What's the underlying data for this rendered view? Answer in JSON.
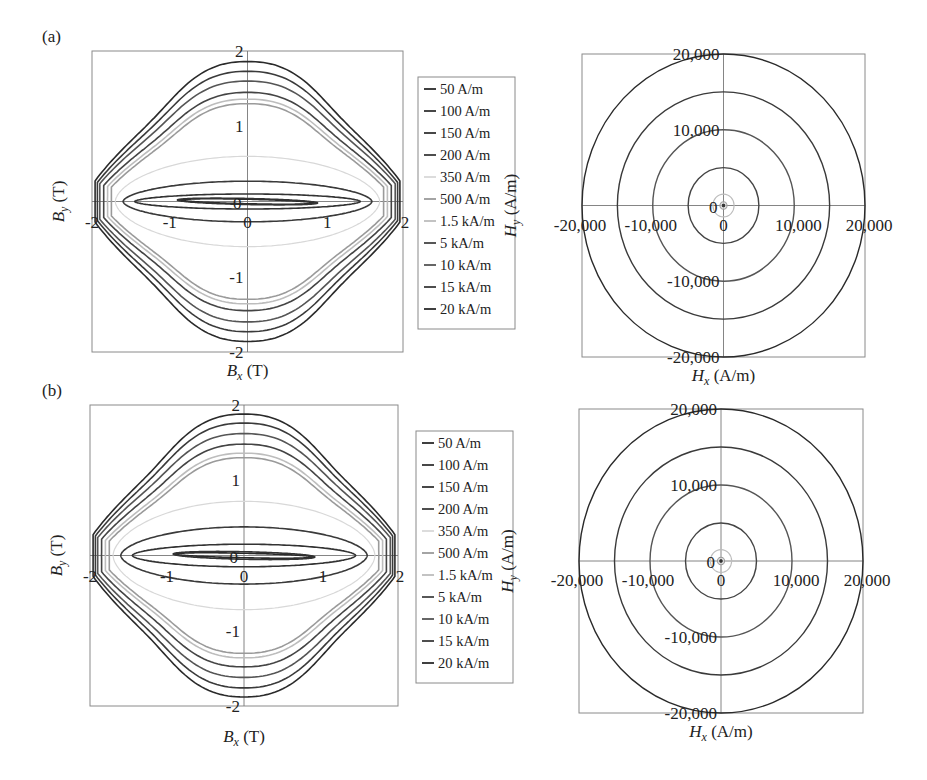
{
  "figure": {
    "panels": [
      "(a)",
      "(b)"
    ]
  },
  "chart_data": [
    {
      "id": "a-B",
      "panel": "(a)",
      "type": "line",
      "title": "",
      "xlabel": "B_x (T)",
      "ylabel": "B_y (T)",
      "xlim": [
        -2,
        2
      ],
      "ylim": [
        -2,
        2
      ],
      "xticks": [
        "-2",
        "-1",
        "0",
        "1",
        "2"
      ],
      "yticks": [
        "-2",
        "-1",
        "0",
        "1",
        "2"
      ],
      "grid": false,
      "legend_position": "right",
      "series": [
        {
          "name": "50 A/m",
          "shape": "thin-loop",
          "bx_max": 0.85,
          "by_max": 0.03,
          "color": "#2a2a2a"
        },
        {
          "name": "100 A/m",
          "shape": "thin-loop",
          "bx_max": 0.9,
          "by_max": 0.04,
          "color": "#333333"
        },
        {
          "name": "150 A/m",
          "shape": "ellipse",
          "bx_max": 1.45,
          "by_max": 0.1,
          "color": "#333333"
        },
        {
          "name": "200 A/m",
          "shape": "ellipse",
          "bx_max": 1.6,
          "by_max": 0.27,
          "color": "#3a3a3a"
        },
        {
          "name": "350 A/m",
          "shape": "ellipse",
          "bx_max": 1.7,
          "by_max": 0.6,
          "color": "#d8d8d8"
        },
        {
          "name": "500 A/m",
          "shape": "rounded-diamond",
          "bx_max": 1.75,
          "by_max": 1.3,
          "color": "#9a9a9a"
        },
        {
          "name": "1.5 kA/m",
          "shape": "rounded-diamond",
          "bx_max": 1.8,
          "by_max": 1.36,
          "color": "#bdbdbd"
        },
        {
          "name": "5 kA/m",
          "shape": "rounded-diamond",
          "bx_max": 1.85,
          "by_max": 1.45,
          "color": "#444444"
        },
        {
          "name": "10 kA/m",
          "shape": "rounded-diamond",
          "bx_max": 1.9,
          "by_max": 1.6,
          "color": "#555555"
        },
        {
          "name": "15 kA/m",
          "shape": "rounded-diamond",
          "bx_max": 1.93,
          "by_max": 1.73,
          "color": "#3a3a3a"
        },
        {
          "name": "20 kA/m",
          "shape": "rounded-diamond",
          "bx_max": 1.96,
          "by_max": 1.86,
          "color": "#2a2a2a"
        }
      ]
    },
    {
      "id": "a-H",
      "panel": "(a)",
      "type": "line",
      "title": "",
      "xlabel": "H_x (A/m)",
      "ylabel": "H_y (A/m)",
      "xlim": [
        -20000,
        20000
      ],
      "ylim": [
        -20000,
        20000
      ],
      "xticks": [
        "-20,000",
        "-10,000",
        "0",
        "10,000",
        "20,000"
      ],
      "yticks": [
        "-20,000",
        "-10,000",
        "0",
        "10,000",
        "20,000"
      ],
      "grid": false,
      "series": [
        {
          "name": "50 A/m",
          "radius": 50,
          "color": "#2a2a2a"
        },
        {
          "name": "100 A/m",
          "radius": 100,
          "color": "#333333"
        },
        {
          "name": "150 A/m",
          "radius": 150,
          "color": "#333333"
        },
        {
          "name": "200 A/m",
          "radius": 200,
          "color": "#3a3a3a"
        },
        {
          "name": "350 A/m",
          "radius": 350,
          "color": "#d8d8d8"
        },
        {
          "name": "500 A/m",
          "radius": 500,
          "color": "#9a9a9a"
        },
        {
          "name": "1.5 kA/m",
          "radius": 1500,
          "color": "#bdbdbd"
        },
        {
          "name": "5 kA/m",
          "radius": 5000,
          "color": "#444444"
        },
        {
          "name": "10 kA/m",
          "radius": 10000,
          "color": "#555555"
        },
        {
          "name": "15 kA/m",
          "radius": 15000,
          "color": "#3a3a3a"
        },
        {
          "name": "20 kA/m",
          "radius": 20000,
          "color": "#2a2a2a"
        }
      ]
    },
    {
      "id": "b-B",
      "panel": "(b)",
      "type": "line",
      "title": "",
      "xlabel": "B_x (T)",
      "ylabel": "B_y (T)",
      "xlim": [
        -2,
        2
      ],
      "ylim": [
        -2,
        2
      ],
      "xticks": [
        "-2",
        "-1",
        "0",
        "1",
        "2"
      ],
      "yticks": [
        "-2",
        "-1",
        "0",
        "1",
        "2"
      ],
      "grid": false,
      "legend_position": "right",
      "series": [
        {
          "name": "50 A/m",
          "shape": "thin-loop",
          "bx_max": 0.9,
          "by_max": 0.03,
          "color": "#2a2a2a"
        },
        {
          "name": "100 A/m",
          "shape": "thin-loop",
          "bx_max": 0.92,
          "by_max": 0.05,
          "color": "#333333"
        },
        {
          "name": "150 A/m",
          "shape": "ellipse",
          "bx_max": 1.45,
          "by_max": 0.15,
          "color": "#333333"
        },
        {
          "name": "200 A/m",
          "shape": "ellipse",
          "bx_max": 1.6,
          "by_max": 0.38,
          "color": "#3a3a3a"
        },
        {
          "name": "350 A/m",
          "shape": "ellipse",
          "bx_max": 1.7,
          "by_max": 0.72,
          "color": "#d8d8d8"
        },
        {
          "name": "500 A/m",
          "shape": "rounded-diamond",
          "bx_max": 1.75,
          "by_max": 1.3,
          "color": "#9a9a9a"
        },
        {
          "name": "1.5 kA/m",
          "shape": "rounded-diamond",
          "bx_max": 1.8,
          "by_max": 1.36,
          "color": "#bdbdbd"
        },
        {
          "name": "5 kA/m",
          "shape": "rounded-diamond",
          "bx_max": 1.85,
          "by_max": 1.48,
          "color": "#444444"
        },
        {
          "name": "10 kA/m",
          "shape": "rounded-diamond",
          "bx_max": 1.9,
          "by_max": 1.62,
          "color": "#555555"
        },
        {
          "name": "15 kA/m",
          "shape": "rounded-diamond",
          "bx_max": 1.93,
          "by_max": 1.76,
          "color": "#3a3a3a"
        },
        {
          "name": "20 kA/m",
          "shape": "rounded-diamond",
          "bx_max": 1.96,
          "by_max": 1.88,
          "color": "#2a2a2a"
        }
      ]
    },
    {
      "id": "b-H",
      "panel": "(b)",
      "type": "line",
      "title": "",
      "xlabel": "H_x (A/m)",
      "ylabel": "H_y (A/m)",
      "xlim": [
        -20000,
        20000
      ],
      "ylim": [
        -20000,
        20000
      ],
      "xticks": [
        "-20,000",
        "-10,000",
        "0",
        "10,000",
        "20,000"
      ],
      "yticks": [
        "-20,000",
        "-10,000",
        "0",
        "10,000",
        "20,000"
      ],
      "grid": false,
      "series": [
        {
          "name": "50 A/m",
          "radius": 50,
          "color": "#2a2a2a"
        },
        {
          "name": "100 A/m",
          "radius": 100,
          "color": "#333333"
        },
        {
          "name": "150 A/m",
          "radius": 150,
          "color": "#333333"
        },
        {
          "name": "200 A/m",
          "radius": 200,
          "color": "#3a3a3a"
        },
        {
          "name": "350 A/m",
          "radius": 350,
          "color": "#d8d8d8"
        },
        {
          "name": "500 A/m",
          "radius": 500,
          "color": "#9a9a9a"
        },
        {
          "name": "1.5 kA/m",
          "radius": 1500,
          "color": "#bdbdbd"
        },
        {
          "name": "5 kA/m",
          "radius": 5000,
          "color": "#444444"
        },
        {
          "name": "10 kA/m",
          "radius": 10000,
          "color": "#555555"
        },
        {
          "name": "15 kA/m",
          "radius": 15000,
          "color": "#3a3a3a"
        },
        {
          "name": "20 kA/m",
          "radius": 20000,
          "color": "#2a2a2a"
        }
      ]
    }
  ]
}
